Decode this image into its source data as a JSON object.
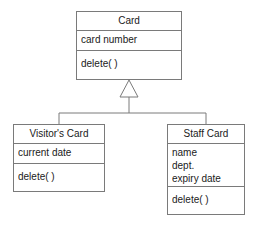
{
  "diagram": {
    "type": "uml-class-diagram",
    "background_color": "#ffffff",
    "line_color": "#7a7a7a",
    "text_color": "#1a1a1a",
    "classes": [
      {
        "id": "card",
        "name": "Card",
        "role": "superclass",
        "attributes": [
          "card number"
        ],
        "operations": [
          "delete( )"
        ]
      },
      {
        "id": "visitors-card",
        "name": "Visitor's Card",
        "role": "subclass",
        "attributes": [
          "current date"
        ],
        "operations": [
          "delete( )"
        ]
      },
      {
        "id": "staff-card",
        "name": "Staff Card",
        "role": "subclass",
        "attributes": [
          "name",
          "dept.",
          "expiry date"
        ],
        "operations": [
          "delete( )"
        ]
      }
    ],
    "relationships": [
      {
        "kind": "generalization",
        "notation": "hollow-triangle",
        "parent": "Card",
        "children": [
          "Visitor's Card",
          "Staff Card"
        ]
      }
    ]
  }
}
